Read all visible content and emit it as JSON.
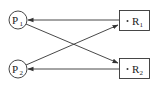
{
  "diagram": {
    "type": "resource-allocation-graph",
    "processes": [
      {
        "id": "P1",
        "label": "P",
        "sub": "1"
      },
      {
        "id": "P2",
        "label": "P",
        "sub": "2"
      }
    ],
    "resources": [
      {
        "id": "R1",
        "label": "R",
        "sub": "1",
        "instances": 1
      },
      {
        "id": "R2",
        "label": "R",
        "sub": "2",
        "instances": 1
      }
    ],
    "edges": [
      {
        "from": "R1",
        "to": "P1",
        "kind": "assignment"
      },
      {
        "from": "P1",
        "to": "R2",
        "kind": "request"
      },
      {
        "from": "P2",
        "to": "R1",
        "kind": "request"
      },
      {
        "from": "R2",
        "to": "P2",
        "kind": "assignment"
      }
    ],
    "colors": {
      "stroke": "#333333",
      "background": "#ffffff"
    }
  }
}
